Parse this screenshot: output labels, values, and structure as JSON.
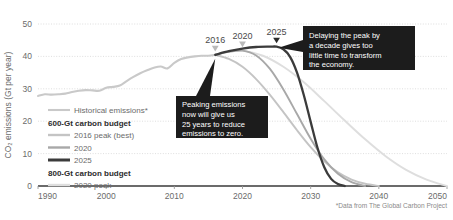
{
  "chart_data": {
    "type": "line",
    "title": "",
    "xlabel": "",
    "ylabel": "CO₂ emissions (Gt per year)",
    "xlim": [
      1990,
      2050
    ],
    "ylim": [
      0,
      50
    ],
    "grid": true,
    "xticks": [
      "1990",
      "2000",
      "2010",
      "2020",
      "2030",
      "2040",
      "2050"
    ],
    "yticks": [
      "0",
      "10",
      "20",
      "30",
      "40",
      "50"
    ],
    "legend_position": "inside-left",
    "source_note": "*Data from The Global Carbon Project",
    "series": [
      {
        "name": "Historical emissions*",
        "color": "#c9c9c9",
        "style": "solid",
        "width": 2.1,
        "x": [
          1990,
          1991,
          1992,
          1993,
          1994,
          1995,
          1996,
          1997,
          1998,
          1999,
          2000,
          2001,
          2002,
          2003,
          2004,
          2005,
          2006,
          2007,
          2008,
          2009,
          2010,
          2011,
          2012,
          2013,
          2014,
          2015,
          2016
        ],
        "values": [
          27.8,
          28.3,
          28.2,
          28.3,
          28.5,
          29.0,
          29.4,
          29.6,
          29.5,
          29.4,
          30.3,
          30.6,
          31.0,
          32.4,
          33.7,
          34.8,
          35.7,
          36.5,
          36.9,
          36.3,
          38.0,
          39.2,
          39.7,
          40.0,
          40.2,
          40.2,
          40.5
        ]
      },
      {
        "name": "2016 peak (best)",
        "budget": "600-Gt carbon budget",
        "color": "#c4c4c4",
        "style": "solid",
        "width": 1.9,
        "x": [
          2016,
          2018,
          2020,
          2022,
          2024,
          2026,
          2028,
          2030,
          2032,
          2034,
          2036,
          2038,
          2040
        ],
        "values": [
          40.5,
          39.2,
          36.8,
          33.0,
          28.2,
          22.8,
          17.2,
          12.0,
          7.6,
          4.2,
          2.0,
          0.7,
          0.0
        ]
      },
      {
        "name": "2020",
        "budget": "600-Gt carbon budget",
        "color": "#a8a8a8",
        "style": "solid",
        "width": 1.9,
        "x": [
          2016,
          2018,
          2020,
          2022,
          2024,
          2026,
          2028,
          2030,
          2032,
          2034,
          2036,
          2038
        ],
        "values": [
          40.5,
          41.4,
          41.8,
          40.3,
          36.2,
          29.8,
          22.2,
          14.6,
          8.2,
          3.8,
          1.2,
          0.0
        ]
      },
      {
        "name": "2025",
        "budget": "600-Gt carbon budget",
        "color": "#3b3b3b",
        "style": "solid",
        "width": 2.3,
        "x": [
          2016,
          2018,
          2020,
          2022,
          2024,
          2025,
          2026,
          2027,
          2028,
          2029,
          2030,
          2031,
          2032,
          2033,
          2034,
          2035
        ],
        "values": [
          40.5,
          41.6,
          42.4,
          42.9,
          43.0,
          43.0,
          42.2,
          39.8,
          35.0,
          28.0,
          19.8,
          11.8,
          5.8,
          2.2,
          0.6,
          0.0
        ]
      },
      {
        "name": "2020 peak",
        "budget": "800-Gt carbon budget",
        "color": "#dedede",
        "style": "solid",
        "width": 1.9,
        "x": [
          2016,
          2018,
          2020,
          2023,
          2026,
          2029,
          2032,
          2035,
          2038,
          2041,
          2044,
          2047,
          2050
        ],
        "values": [
          40.5,
          41.4,
          41.8,
          40.2,
          36.8,
          32.0,
          26.2,
          20.2,
          14.4,
          9.2,
          5.0,
          2.0,
          0.0
        ]
      }
    ],
    "peak_markers": [
      {
        "label": "2016",
        "year": 2016,
        "value": 40.5,
        "emphasis": "light"
      },
      {
        "label": "2020",
        "year": 2020,
        "value": 41.8,
        "emphasis": "light"
      },
      {
        "label": "2025",
        "year": 2025,
        "value": 43.0,
        "emphasis": "dark"
      }
    ],
    "annotations": [
      {
        "id": "peaking-now",
        "lines": [
          "Peaking emissions",
          "now will give us",
          "25 years to reduce",
          "emissions to zero."
        ],
        "background": "#1c1c1c",
        "text_color": "#ffffff"
      },
      {
        "id": "delaying-peak",
        "lines": [
          "Delaying the peak by",
          "a decade gives too",
          "little time to transform",
          "the economy."
        ],
        "background": "#1c1c1c",
        "text_color": "#ffffff"
      }
    ]
  },
  "legend": {
    "entries": [
      {
        "kind": "series",
        "label": "Historical emissions*",
        "color": "#c9c9c9",
        "width": 2.1
      },
      {
        "kind": "header",
        "label": "600-Gt carbon budget"
      },
      {
        "kind": "series",
        "label": "2016 peak (best)",
        "color": "#c4c4c4",
        "width": 2.4
      },
      {
        "kind": "series",
        "label": "2020",
        "color": "#a8a8a8",
        "width": 2.4
      },
      {
        "kind": "series",
        "label": "2025",
        "color": "#3b3b3b",
        "width": 3.0
      },
      {
        "kind": "header",
        "label": "800-Gt carbon budget"
      },
      {
        "kind": "series",
        "label": "2020 peak",
        "color": "#dedede",
        "width": 2.4
      }
    ]
  }
}
